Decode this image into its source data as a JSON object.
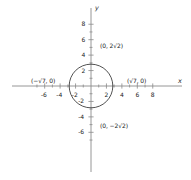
{
  "chart_data": {
    "type": "scatter",
    "title": "",
    "xlabel": "x",
    "ylabel": "y",
    "xlim": [
      -7,
      8
    ],
    "ylim": [
      -7,
      8
    ],
    "grid": false,
    "legend": null,
    "x_ticks": [
      -6,
      -4,
      -2,
      2,
      4,
      6,
      8
    ],
    "y_ticks": [
      8,
      6,
      4,
      2,
      -2,
      -4,
      -6
    ],
    "x_tick_labels": [
      "-6",
      "-4",
      "-2",
      "2",
      "4",
      "6",
      "8"
    ],
    "y_tick_labels": [
      "8",
      "6",
      "4",
      "2",
      "-2",
      "-4",
      "-6"
    ],
    "shapes": [
      {
        "kind": "circle",
        "center": [
          0,
          0
        ],
        "radius": 2.828,
        "radius_expr": "2√2",
        "equation": "x² + y² = 8",
        "stroke": "#333333",
        "fill": "none"
      }
    ],
    "annotations": [
      {
        "name": "top-point",
        "text": "(0, 2√2)",
        "x": 0,
        "y": 2.828
      },
      {
        "name": "bottom-point",
        "text": "(0, −2√2)",
        "x": 0,
        "y": -2.828
      },
      {
        "name": "right-point",
        "text": "(√7, 0)",
        "x": 2.646,
        "y": 0
      },
      {
        "name": "left-point",
        "text": "(−√7, 0)",
        "x": -2.646,
        "y": 0
      }
    ]
  },
  "axes": {
    "x_axis_label": "x",
    "y_axis_label": "y",
    "x_ticks": [
      {
        "value": -6,
        "label": "-6"
      },
      {
        "value": -4,
        "label": "-4"
      },
      {
        "value": -2,
        "label": "-2"
      },
      {
        "value": 2,
        "label": "2"
      },
      {
        "value": 4,
        "label": "4"
      },
      {
        "value": 6,
        "label": "6"
      },
      {
        "value": 8,
        "label": "8"
      }
    ],
    "y_ticks": [
      {
        "value": 8,
        "label": "8"
      },
      {
        "value": 6,
        "label": "6"
      },
      {
        "value": 4,
        "label": "4"
      },
      {
        "value": 2,
        "label": "2"
      },
      {
        "value": -2,
        "label": "-2"
      },
      {
        "value": -4,
        "label": "-4"
      },
      {
        "value": -6,
        "label": "-6"
      }
    ]
  },
  "labels": {
    "top": "(0, 2√2)",
    "bottom": "(0, −2√2)",
    "right": "(√7, 0)",
    "left": "(−√7, 0)"
  },
  "colors": {
    "background": "#ffffff",
    "axis": "#8a8a8a",
    "curve": "#333333",
    "text": "#1a1a1a"
  }
}
